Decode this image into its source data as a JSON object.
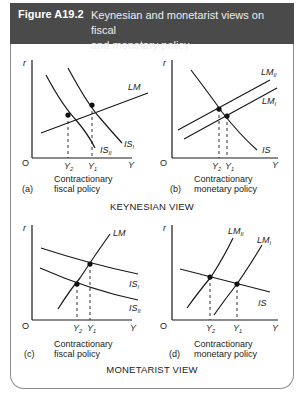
{
  "figure": {
    "number": "Figure A19.2",
    "title": "Keynesian and monetarist views on fiscal and monetary policy",
    "title_line1": "Keynesian and monetarist views on fiscal",
    "title_line2": "and monetary policy"
  },
  "sections": [
    {
      "label": "KEYNESIAN VIEW"
    },
    {
      "label": "MONETARIST VIEW"
    }
  ],
  "panels": [
    {
      "id": "a",
      "tag": "(a)",
      "caption1": "Contractionary",
      "caption2": "fiscal policy",
      "axis_y": "r",
      "axis_x": "Y",
      "origin": "O",
      "curves": [
        "LM",
        "IS_I",
        "IS_II"
      ],
      "x_ticks": [
        "Y2",
        "Y1"
      ]
    },
    {
      "id": "b",
      "tag": "(b)",
      "caption1": "Contractionary",
      "caption2": "monetary policy",
      "axis_y": "r",
      "axis_x": "Y",
      "origin": "O",
      "curves": [
        "LM_II",
        "LM_I",
        "IS"
      ],
      "x_ticks": [
        "Y2",
        "Y1"
      ]
    },
    {
      "id": "c",
      "tag": "(c)",
      "caption1": "Contractionary",
      "caption2": "fiscal policy",
      "axis_y": "r",
      "axis_x": "Y",
      "origin": "O",
      "curves": [
        "LM",
        "IS_I",
        "IS_II"
      ],
      "x_ticks": [
        "Y2",
        "Y1"
      ]
    },
    {
      "id": "d",
      "tag": "(d)",
      "caption1": "Contractionary",
      "caption2": "monetary policy",
      "axis_y": "r",
      "axis_x": "Y",
      "origin": "O",
      "curves": [
        "LM_II",
        "LM_I",
        "IS"
      ],
      "x_ticks": [
        "Y2",
        "Y1"
      ]
    }
  ],
  "labels": {
    "r": "r",
    "Y": "Y",
    "O": "O",
    "LM": "LM",
    "IS": "IS",
    "sub_I": "I",
    "sub_II": "II",
    "Y_base": "Y",
    "sub_1": "1",
    "sub_2": "2"
  },
  "colors": {
    "header_bg": "#4a4a4a",
    "line": "#1a1a1a",
    "frame": "#8a8a8a"
  }
}
